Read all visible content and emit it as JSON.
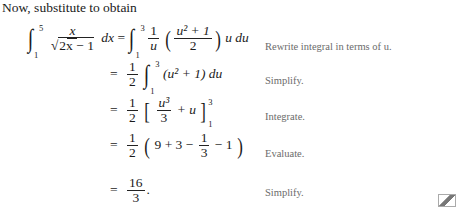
{
  "intro": "Now, substitute to obtain",
  "steps": [
    {
      "lhs": {
        "lower": "1",
        "upper": "5",
        "numerator": "x",
        "denominator": "2x − 1",
        "differential": "dx"
      },
      "rhs": {
        "lower": "1",
        "upper": "3",
        "coef_num": "1",
        "coef_den": "u",
        "inner_num": "u² + 1",
        "inner_den": "2",
        "tail": "u du"
      },
      "note": "Rewrite integral in terms of u."
    },
    {
      "expr": {
        "coef_num": "1",
        "coef_den": "2",
        "lower": "1",
        "upper": "3",
        "body": "(u² + 1) du"
      },
      "note": "Simplify."
    },
    {
      "expr": {
        "coef_num": "1",
        "coef_den": "2",
        "term_num": "u³",
        "term_den": "3",
        "plus": "+ u",
        "lower": "1",
        "upper": "3"
      },
      "note": "Integrate."
    },
    {
      "expr": {
        "coef_num": "1",
        "coef_den": "2",
        "a": "9 + 3 −",
        "f_num": "1",
        "f_den": "3",
        "b": "− 1"
      },
      "note": "Evaluate."
    },
    {
      "expr": {
        "num": "16",
        "den": "3"
      },
      "note": "Simplify."
    }
  ],
  "end_mark": "end-of-example-icon"
}
